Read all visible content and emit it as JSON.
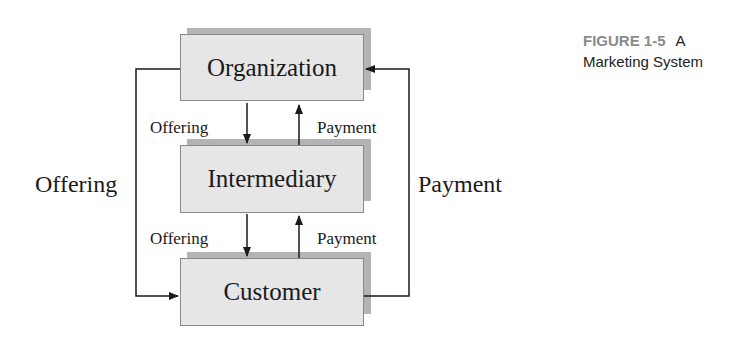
{
  "caption": {
    "figure_number": "FIGURE 1-5",
    "title_line1": "A",
    "title_line2": "Marketing System"
  },
  "nodes": [
    {
      "id": "organization",
      "label": "Organization"
    },
    {
      "id": "intermediary",
      "label": "Intermediary"
    },
    {
      "id": "customer",
      "label": "Customer"
    }
  ],
  "edges": {
    "org_to_intermediary": "Offering",
    "intermediary_to_org": "Payment",
    "intermediary_to_customer": "Offering",
    "customer_to_intermediary": "Payment",
    "org_to_customer": "Offering",
    "customer_to_org": "Payment"
  },
  "colors": {
    "box_fill": "#e6e6e6",
    "box_shadow": "#b4b4b4",
    "caption_gray": "#8a8a8a"
  }
}
